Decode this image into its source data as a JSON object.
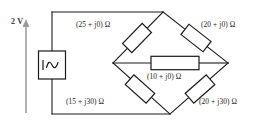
{
  "diagram": {
    "source": {
      "label": "2 V",
      "symbol_name": "ac-sine-source",
      "arrow_name": "voltage-arrow",
      "arrow_color": "#9a9a9a"
    },
    "colors": {
      "wire": "#1a1a1a",
      "component_fill": "#ffffff",
      "text": "#1a1a1a",
      "arrow": "#9a9a9a",
      "background": "#ffffff"
    },
    "branches": [
      {
        "id": "top-left",
        "label": "(25 + j0) Ω",
        "position": "upper-left"
      },
      {
        "id": "top-right",
        "label": "(20 + j0) Ω",
        "position": "upper-right"
      },
      {
        "id": "bridge-mid",
        "label": "(10 + j0) Ω",
        "position": "center"
      },
      {
        "id": "bottom-left",
        "label": "(15 + j30) Ω",
        "position": "lower-left"
      },
      {
        "id": "bottom-right",
        "label": "(20 + j30) Ω",
        "position": "lower-right"
      }
    ]
  }
}
